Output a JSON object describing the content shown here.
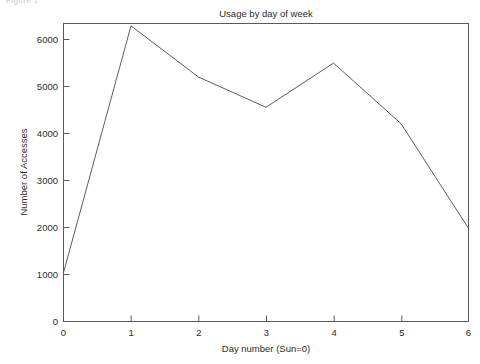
{
  "figure": {
    "caption": "Figure 1"
  },
  "chart_data": {
    "type": "line",
    "title": "Usage by day of week",
    "xlabel": "Day number (Sun=0)",
    "ylabel": "Number of Accesses",
    "x": [
      0,
      1,
      2,
      3,
      4,
      5,
      6
    ],
    "values": [
      1050,
      6350,
      5250,
      4600,
      5550,
      4250,
      2000
    ],
    "series": [
      {
        "name": "Number of Accesses",
        "values": [
          1050,
          6350,
          5250,
          4600,
          5550,
          4250,
          2000
        ]
      }
    ],
    "xlim": [
      0,
      6
    ],
    "ylim": [
      0,
      6400
    ],
    "xticks": [
      "0",
      "1",
      "2",
      "3",
      "4",
      "5",
      "6"
    ],
    "xtick_values": [
      0,
      1,
      2,
      3,
      4,
      5,
      6
    ],
    "yticks": [
      "0",
      "1000",
      "2000",
      "3000",
      "4000",
      "5000",
      "6000"
    ],
    "ytick_values": [
      0,
      1000,
      2000,
      3000,
      4000,
      5000,
      6000
    ],
    "grid": false,
    "legend": false,
    "legend_position": "none",
    "line_color": "#4a4a4a",
    "background_color": "#ffffff",
    "markers": false
  }
}
